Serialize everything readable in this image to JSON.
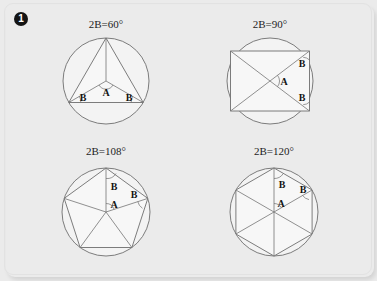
{
  "plate": {
    "item_marker": "1",
    "item_marker_icon": "circled-number-one-icon",
    "background_color": "#ebebeb",
    "frame_color": "#e2e2e2"
  },
  "style": {
    "stroke_color": "#6e6e6e",
    "polygon_fill": "#f7f7f7",
    "circle_fill": "#f3f3f3",
    "label_color": "#141414"
  },
  "panels": [
    {
      "id": "triangle-panel",
      "title_prefix": "2B=",
      "title_value": "60",
      "title_degree": "°",
      "title": "2B=60°",
      "polygon_name": "equilateral-triangle",
      "sides": 3,
      "central_angle_A": 120,
      "base_angle_B": 30,
      "labels": [
        "B",
        "A",
        "B"
      ]
    },
    {
      "id": "square-panel",
      "title_prefix": "2B=",
      "title_value": "90",
      "title_degree": "°",
      "title": "2B=90°",
      "polygon_name": "square",
      "sides": 4,
      "central_angle_A": 90,
      "base_angle_B": 45,
      "labels": [
        "B",
        "A",
        "B"
      ]
    },
    {
      "id": "pentagon-panel",
      "title_prefix": "2B=",
      "title_value": "108",
      "title_degree": "°",
      "title": "2B=108°",
      "polygon_name": "regular-pentagon",
      "sides": 5,
      "central_angle_A": 72,
      "base_angle_B": 54,
      "labels": [
        "B",
        "A",
        "B"
      ]
    },
    {
      "id": "hexagon-panel",
      "title_prefix": "2B=",
      "title_value": "120",
      "title_degree": "°",
      "title": "2B=120°",
      "polygon_name": "regular-hexagon",
      "sides": 6,
      "central_angle_A": 60,
      "base_angle_B": 60,
      "labels": [
        "B",
        "A",
        "B"
      ]
    }
  ]
}
